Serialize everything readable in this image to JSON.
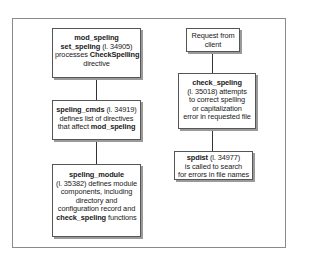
{
  "diagram": {
    "left_column": [
      {
        "id": "mod_speling",
        "lines": [
          [
            {
              "t": "mod_speling",
              "b": true
            }
          ],
          [
            {
              "t": "set_speling",
              "b": true
            },
            {
              "t": " (l. 34905)",
              "b": false
            }
          ],
          [
            {
              "t": "processes ",
              "b": false
            },
            {
              "t": "CheckSpelling",
              "b": true
            }
          ],
          [
            {
              "t": "directive",
              "b": false
            }
          ]
        ]
      },
      {
        "id": "speling_cmds",
        "lines": [
          [
            {
              "t": "speling_cmds",
              "b": true
            },
            {
              "t": " (l. 34919)",
              "b": false
            }
          ],
          [
            {
              "t": "defines list of directives",
              "b": false
            }
          ],
          [
            {
              "t": "that affect ",
              "b": false
            },
            {
              "t": "mod_speling",
              "b": true
            }
          ]
        ]
      },
      {
        "id": "speling_module",
        "lines": [
          [
            {
              "t": "speling_module",
              "b": true
            }
          ],
          [
            {
              "t": "(l. 35382) defines module",
              "b": false
            }
          ],
          [
            {
              "t": "components, including",
              "b": false
            }
          ],
          [
            {
              "t": "directory and",
              "b": false
            }
          ],
          [
            {
              "t": "configuration record and",
              "b": false
            }
          ],
          [
            {
              "t": "check_speling",
              "b": true
            },
            {
              "t": " functions",
              "b": false
            }
          ]
        ]
      }
    ],
    "right_column": [
      {
        "id": "request",
        "lines": [
          [
            {
              "t": "Request from",
              "b": false
            }
          ],
          [
            {
              "t": "client",
              "b": false
            }
          ]
        ]
      },
      {
        "id": "check_speling",
        "lines": [
          [
            {
              "t": "check_speling",
              "b": true
            }
          ],
          [
            {
              "t": "(l. 35018) attempts",
              "b": false
            }
          ],
          [
            {
              "t": "to correct spelling",
              "b": false
            }
          ],
          [
            {
              "t": "or capitalization",
              "b": false
            }
          ],
          [
            {
              "t": "error in requested file",
              "b": false
            }
          ]
        ]
      },
      {
        "id": "spdist",
        "lines": [
          [
            {
              "t": "spdist",
              "b": true
            },
            {
              "t": " (l. 34977)",
              "b": false
            }
          ],
          [
            {
              "t": "is called to search",
              "b": false
            }
          ],
          [
            {
              "t": "for errors in file names",
              "b": false
            }
          ]
        ]
      }
    ]
  }
}
